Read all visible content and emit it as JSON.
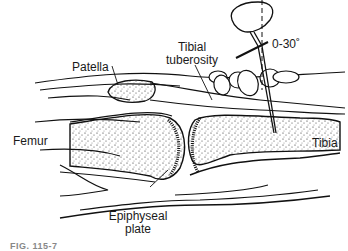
{
  "figure": {
    "type": "anatomical line illustration",
    "labels": {
      "patella": "Patella",
      "tibial_tuberosity_line1": "Tibial",
      "tibial_tuberosity_line2": "tuberosity",
      "angle": "0-30˚",
      "femur": "Femur",
      "tibia": "Tibia",
      "epiphyseal_line1": "Epiphyseal",
      "epiphyseal_line2": "plate"
    },
    "caption": "FIG. 115-7"
  },
  "colors": {
    "line": "#111111",
    "background": "#ffffff"
  }
}
